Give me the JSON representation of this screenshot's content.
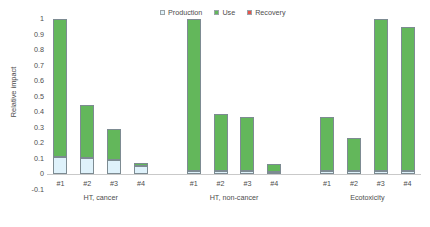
{
  "chart_data": {
    "type": "bar",
    "subtype": "stacked-bar",
    "title": "",
    "xlabel": "",
    "ylabel": "Relative impact",
    "ylim": [
      -0.1,
      1.0
    ],
    "ytick_labels": [
      "1",
      "0.9",
      "0.8",
      "0.7",
      "0.6",
      "0.5",
      "0.4",
      "0.3",
      "0.2",
      "0.1",
      "0",
      "-0.1"
    ],
    "ytick_values": [
      1,
      0.9,
      0.8,
      0.7,
      0.6,
      0.5,
      0.4,
      0.3,
      0.2,
      0.1,
      0,
      -0.1
    ],
    "grid": false,
    "legend_position": "top-right",
    "legend": [
      "Production",
      "Use",
      "Recovery"
    ],
    "series_colors": {
      "Production": "#dff2fb",
      "Use": "#63b75b",
      "Recovery": "#e8534a"
    },
    "categories": [
      "#1",
      "#2",
      "#3",
      "#4",
      "#1",
      "#2",
      "#3",
      "#4",
      "#1",
      "#2",
      "#3",
      "#4"
    ],
    "groups": [
      {
        "label": "HT, cancer",
        "categories": [
          "#1",
          "#2",
          "#3",
          "#4"
        ]
      },
      {
        "label": "HT, non-cancer",
        "categories": [
          "#1",
          "#2",
          "#3",
          "#4"
        ]
      },
      {
        "label": "Ecotoxicity",
        "categories": [
          "#1",
          "#2",
          "#3",
          "#4"
        ]
      }
    ],
    "series": [
      {
        "name": "Production",
        "values": [
          0.11,
          0.105,
          0.09,
          0.05,
          0.02,
          0.02,
          0.02,
          0.012,
          0.02,
          0.02,
          0.02,
          0.017
        ]
      },
      {
        "name": "Use",
        "values": [
          0.89,
          0.34,
          0.2,
          0.02,
          0.98,
          0.365,
          0.345,
          0.053,
          0.35,
          0.21,
          0.98,
          0.933
        ]
      },
      {
        "name": "Recovery",
        "values": [
          0,
          0,
          0,
          0,
          0,
          0,
          0,
          0,
          0,
          0,
          0,
          0
        ]
      }
    ],
    "totals": [
      1.0,
      0.445,
      0.29,
      0.07,
      1.0,
      0.385,
      0.365,
      0.065,
      0.37,
      0.23,
      1.0,
      0.95
    ]
  },
  "legend_entries": [
    {
      "label": "Production",
      "color": "#dff2fb",
      "icon": "square-swatch-icon"
    },
    {
      "label": "Use",
      "color": "#63b75b",
      "icon": "square-swatch-icon"
    },
    {
      "label": "Recovery",
      "color": "#e8534a",
      "icon": "square-swatch-icon"
    }
  ]
}
